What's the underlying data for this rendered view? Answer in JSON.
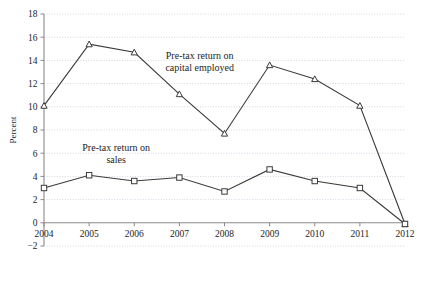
{
  "chart_data": {
    "type": "line",
    "title": "",
    "xlabel": "",
    "ylabel": "Percent",
    "categories": [
      "2004",
      "2005",
      "2006",
      "2007",
      "2008",
      "2009",
      "2010",
      "2011",
      "2012"
    ],
    "x": [
      2004,
      2005,
      2006,
      2007,
      2008,
      2009,
      2010,
      2011,
      2012
    ],
    "ylim": [
      -2,
      18
    ],
    "ytick_step": 2,
    "yticks": [
      -2,
      0,
      2,
      4,
      6,
      8,
      10,
      12,
      14,
      16,
      18
    ],
    "ytick_labels": [
      "−2",
      "0",
      "2",
      "4",
      "6",
      "8",
      "10",
      "12",
      "14",
      "16",
      "18"
    ],
    "grid": true,
    "grid_color": "#b9c6d6",
    "legend_position": "inline-annotation",
    "series": [
      {
        "name": "Pre-tax return on capital employed",
        "annotation": [
          "Pre-tax return on",
          "capital employed"
        ],
        "marker": "triangle",
        "color": "#3a3a3a",
        "values": [
          10.1,
          15.4,
          14.7,
          11.1,
          7.7,
          13.6,
          12.4,
          10.1,
          -0.1
        ]
      },
      {
        "name": "Pre-tax return on sales",
        "annotation": [
          "Pre-tax return on",
          "sales"
        ],
        "marker": "square",
        "color": "#3a3a3a",
        "values": [
          3.0,
          4.1,
          3.6,
          3.9,
          2.7,
          4.6,
          3.6,
          3.0,
          -0.1
        ]
      }
    ],
    "annotations": [
      {
        "lines": [
          "Pre-tax return on",
          "capital employed"
        ],
        "x": 2007.45,
        "y": 14.1,
        "name": "annotation-capital-employed"
      },
      {
        "lines": [
          "Pre-tax return on",
          "sales"
        ],
        "x": 2005.6,
        "y": 6.15,
        "name": "annotation-sales"
      }
    ]
  }
}
